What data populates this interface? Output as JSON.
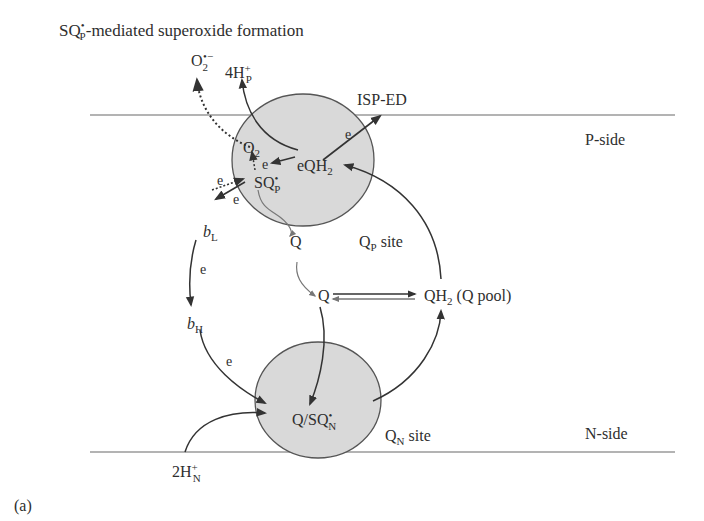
{
  "title_parts": {
    "main": "SQ",
    "sup": "•",
    "sub": "P",
    "rest": "-mediated superoxide formation"
  },
  "panel_label": "(a)",
  "membrane": {
    "p_side_label": "P-side",
    "n_side_label": "N-side"
  },
  "sites": {
    "qp": {
      "label_main": "Q",
      "label_sub": "P",
      "label_rest": " site"
    },
    "qn": {
      "label_main": "Q",
      "label_sub": "N",
      "label_rest": " site"
    }
  },
  "species": {
    "superoxide": {
      "main": "O",
      "sub": "2",
      "sup": "•−"
    },
    "protons_p": {
      "main": "4H",
      "sub": "P",
      "sup": "+"
    },
    "isp_ed": "ISP-ED",
    "o2": {
      "main": "O",
      "sub": "2"
    },
    "qh2_p": {
      "prefix": "e",
      "main": "QH",
      "sub": "2"
    },
    "sqp": {
      "main": "SQ",
      "sub": "P",
      "sup": "•"
    },
    "q_released": "Q",
    "q_pool_q": "Q",
    "q_pool_qh2": {
      "main": "QH",
      "sub": "2",
      "rest": " (Q pool)"
    },
    "bl": {
      "main": "b",
      "sub": "L"
    },
    "bh": {
      "main": "b",
      "sub": "H"
    },
    "q_sqn": {
      "main": "Q/SQ",
      "sub": "N",
      "sup": "•"
    },
    "protons_n": {
      "main": "2H",
      "sub": "N",
      "sup": "+"
    }
  },
  "electron_labels": [
    "e",
    "e",
    "e",
    "e",
    "e",
    "e",
    "e"
  ],
  "colors": {
    "circle_fill": "#d9d9d9",
    "circle_stroke": "#555555",
    "arrow": "#333333",
    "membrane_line": "#9a9a9a",
    "text": "#2e2e2e"
  }
}
